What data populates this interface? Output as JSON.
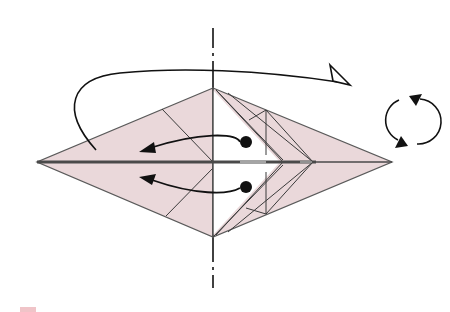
{
  "diagram": {
    "colors": {
      "paper_color": "#ead8da",
      "back_color": "#ffffff",
      "line_color": "#555555",
      "arrow_color": "#111111",
      "center_line_color": "#4a4a4a",
      "footer_mark_color": "#f0c4c8"
    },
    "symbols": [
      {
        "name": "fold-axis",
        "type": "dash-dot vertical line",
        "x": 213
      },
      {
        "name": "flip-arrow",
        "type": "turn-over arrow with hollow head"
      },
      {
        "name": "swing-arrow-upper",
        "type": "curved arrow from dot to left"
      },
      {
        "name": "swing-arrow-lower",
        "type": "curved arrow from dot to left"
      },
      {
        "name": "rotate-symbol",
        "type": "circular rotation icon (turn model over)"
      }
    ],
    "labels": []
  }
}
